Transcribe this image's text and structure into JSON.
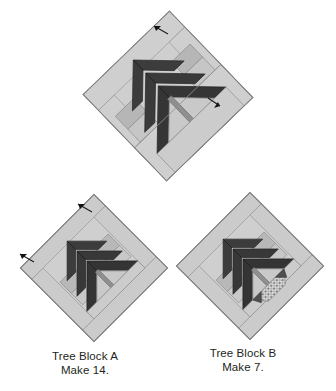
{
  "figure": {
    "background_color": "#ffffff"
  },
  "palette": {
    "background": "#ffffff",
    "light_border": "#cfcfcf",
    "light_border_alt": "#c2c2c2",
    "mid_gray": "#b3b3b3",
    "pale_gray": "#d8d8d8",
    "dark_foliage": "#3a3a3a",
    "dark_foliage_alt": "#333333",
    "trunk_gray": "#8f8f8f",
    "outline": "#6e6e6e",
    "arrow": "#1a1a1a",
    "speckle_dark": "#5a5a5a",
    "speckle_light": "#e2e2e2",
    "text": "#231f20"
  },
  "blocks": [
    {
      "id": "block-top",
      "name": "tree-block-exploded-top",
      "rotation_deg": -44,
      "has_caption": false,
      "has_base_patch": false,
      "arrow_markers": 2,
      "size_px": 118
    },
    {
      "id": "block-a",
      "name": "tree-block-a",
      "rotation_deg": -45,
      "has_caption": true,
      "has_base_patch": false,
      "arrow_markers": 2,
      "size_px": 104
    },
    {
      "id": "block-b",
      "name": "tree-block-b",
      "rotation_deg": -45,
      "has_caption": true,
      "has_base_patch": true,
      "arrow_markers": 0,
      "size_px": 104
    }
  ],
  "captions": {
    "block_a": {
      "line1": "Tree Block A",
      "line2": "Make 14."
    },
    "block_b": {
      "line1": "Tree Block B",
      "line2": "Make 7."
    }
  }
}
